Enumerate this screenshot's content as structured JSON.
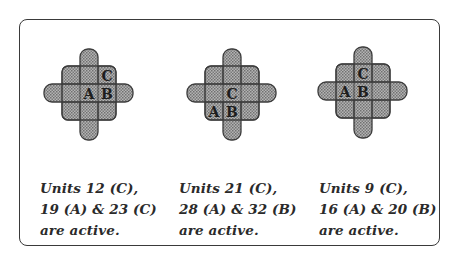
{
  "diagram": {
    "colors": {
      "frame": "#3a3a3a",
      "shape_fill": "#9a9a9a",
      "shape_stroke": "#3c3c3c",
      "text": "#2a2a2a"
    },
    "panels": [
      {
        "id": "panel-1",
        "labels": [
          {
            "text": "A",
            "row": 2,
            "col": 2
          },
          {
            "text": "B",
            "row": 2,
            "col": 3
          },
          {
            "text": "C",
            "row": 1,
            "col": 3
          }
        ],
        "caption": {
          "line1": "Units 12 (C),",
          "line2": "19 (A) & 23 (C)",
          "line3": "are active."
        }
      },
      {
        "id": "panel-2",
        "labels": [
          {
            "text": "C",
            "row": 2,
            "col": 2
          },
          {
            "text": "A",
            "row": 3,
            "col": 1
          },
          {
            "text": "B",
            "row": 3,
            "col": 2
          }
        ],
        "caption": {
          "line1": "Units 21 (C),",
          "line2": "28 (A) & 32 (B)",
          "line3": "are active."
        }
      },
      {
        "id": "panel-3",
        "labels": [
          {
            "text": "C",
            "row": 1,
            "col": 2
          },
          {
            "text": "A",
            "row": 2,
            "col": 1
          },
          {
            "text": "B",
            "row": 2,
            "col": 2
          }
        ],
        "caption": {
          "line1": "Units 9 (C),",
          "line2": "16 (A) & 20 (B)",
          "line3": "are active."
        }
      }
    ]
  }
}
